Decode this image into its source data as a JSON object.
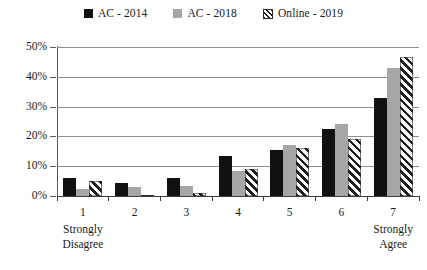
{
  "chart_data": {
    "type": "bar",
    "title": "",
    "xlabel": "",
    "ylabel": "",
    "ylim": [
      0,
      50
    ],
    "yticks": [
      0,
      10,
      20,
      30,
      40,
      50
    ],
    "ytick_labels": [
      "0%",
      "10%",
      "20%",
      "30%",
      "40%",
      "50%"
    ],
    "grid": true,
    "legend_position": "top-center",
    "categories": [
      "1",
      "2",
      "3",
      "4",
      "5",
      "6",
      "7"
    ],
    "category_sublabels": [
      "Strongly\nDisagree",
      "",
      "",
      "",
      "",
      "",
      "Strongly\nAgree"
    ],
    "series": [
      {
        "name": "AC - 2014",
        "style": "solid-black",
        "color": "#111111",
        "values": [
          6.0,
          4.5,
          6.0,
          13.5,
          15.5,
          22.5,
          33.0
        ]
      },
      {
        "name": "AC - 2018",
        "style": "solid-gray",
        "color": "#a6a6a6",
        "values": [
          2.5,
          3.0,
          3.5,
          8.5,
          17.0,
          24.0,
          43.0
        ]
      },
      {
        "name": "Online - 2019",
        "style": "diagonal-hatch",
        "color": "#ffffff",
        "values": [
          5.0,
          0.5,
          1.0,
          9.0,
          16.0,
          19.0,
          46.5
        ]
      }
    ]
  },
  "legend": {
    "items": [
      {
        "label": "AC - 2014",
        "swatch": "black-square-icon"
      },
      {
        "label": "AC - 2018",
        "swatch": "gray-square-icon"
      },
      {
        "label": "Online - 2019",
        "swatch": "hatched-square-icon"
      }
    ]
  }
}
